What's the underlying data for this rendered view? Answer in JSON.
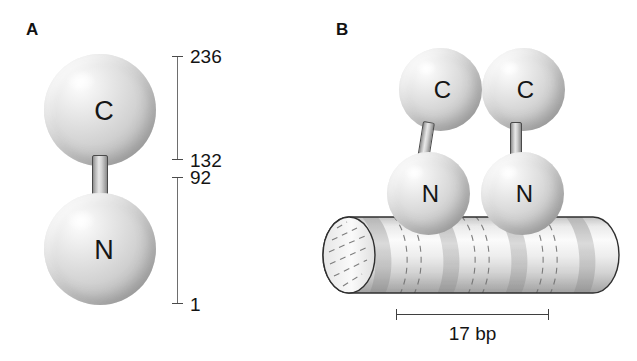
{
  "figure": {
    "background": "#ffffff",
    "sphere_color": "#d9d9d9",
    "dna_color": "#bfbfbf",
    "line_color": "#3f3f3f"
  },
  "panel_a": {
    "label": "A",
    "domains": [
      {
        "id": "c-domain",
        "symbol": "C"
      },
      {
        "id": "n-domain",
        "symbol": "N"
      }
    ],
    "scale": {
      "c_range": {
        "top_label": "236",
        "bottom_label": "132"
      },
      "n_range": {
        "top_label": "92",
        "bottom_label": "1"
      }
    }
  },
  "panel_b": {
    "label": "B",
    "monomers": [
      {
        "id": "monomer-left",
        "c_symbol": "C",
        "n_symbol": "N"
      },
      {
        "id": "monomer-right",
        "c_symbol": "C",
        "n_symbol": "N"
      }
    ],
    "dna": {
      "name": "dna-duplex",
      "footprint_label": "17 bp"
    }
  }
}
